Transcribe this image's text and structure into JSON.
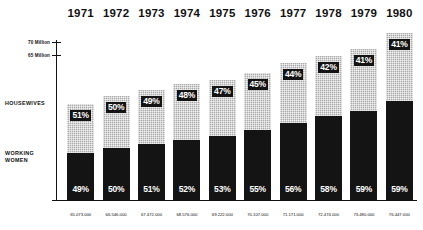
{
  "chart_data": {
    "type": "bar",
    "title": "",
    "subtitle": "",
    "xlabel": "",
    "ylabel": "",
    "stacked": true,
    "grid": false,
    "legend_position": "left-inline",
    "categories": [
      "1971",
      "1972",
      "1973",
      "1974",
      "1975",
      "1976",
      "1977",
      "1978",
      "1979",
      "1980"
    ],
    "series": [
      {
        "name": "HOUSEWIVES",
        "unit": "%",
        "values": [
          51,
          50,
          49,
          48,
          47,
          45,
          44,
          42,
          41,
          41
        ],
        "labels": [
          "51%",
          "50%",
          "49%",
          "48%",
          "47%",
          "45%",
          "44%",
          "42%",
          "41%",
          "41%"
        ],
        "fill": "halftone-screen",
        "color": "#a9a9a9"
      },
      {
        "name": "WORKING WOMEN",
        "unit": "%",
        "values": [
          49,
          50,
          51,
          52,
          53,
          55,
          56,
          58,
          59,
          59
        ],
        "labels": [
          "49%",
          "50%",
          "51%",
          "52%",
          "53%",
          "55%",
          "56%",
          "58%",
          "59%",
          "59%"
        ],
        "fill": "solid",
        "color": "#141414"
      }
    ],
    "totals": {
      "label": "",
      "values": [
        65073000,
        66546000,
        67472000,
        68576000,
        69222000,
        70107000,
        71171000,
        72474000,
        73480000,
        76447000
      ],
      "formatted": [
        "65.073.000",
        "66.546.000",
        "67.472.000",
        "68.576.000",
        "69.222.000",
        "70.107.000",
        "71.171.000",
        "72.474.000",
        "73.480.000",
        "76.447.000"
      ]
    },
    "bar_total_heights_px": [
      96,
      104,
      110,
      116,
      120,
      127,
      137,
      144,
      151,
      167
    ],
    "y_axis": {
      "ticks": [
        {
          "label": "70 Million",
          "value": 70000000
        },
        {
          "label": "65 Million",
          "value": 65000000
        }
      ],
      "ylim": [
        0,
        78000000
      ]
    }
  },
  "colors": {
    "ink": "#111111",
    "housewives": "#a9a9a9",
    "working_women": "#141414",
    "background": "#ffffff"
  }
}
